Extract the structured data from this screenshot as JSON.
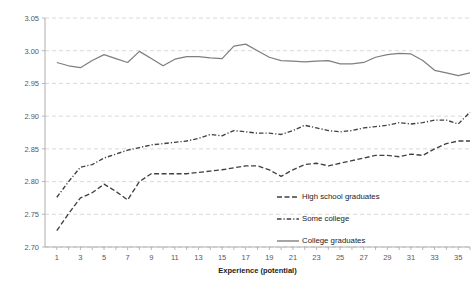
{
  "chart_data": {
    "type": "line",
    "title": "",
    "xlabel": "Experience (potential)",
    "ylabel": "",
    "xlim": [
      0,
      36
    ],
    "ylim": [
      2.7,
      3.05
    ],
    "grid": true,
    "legend_position": "center-right-inside",
    "ytick_labels": [
      "2.70",
      "2.75",
      "2.80",
      "2.85",
      "2.90",
      "2.95",
      "3.00",
      "3.05"
    ],
    "ytick_values": [
      2.7,
      2.75,
      2.8,
      2.85,
      2.9,
      2.95,
      3.0,
      3.05
    ],
    "xtick_labels": [
      "1",
      "3",
      "5",
      "7",
      "9",
      "11",
      "13",
      "15",
      "17",
      "19",
      "21",
      "23",
      "25",
      "27",
      "29",
      "31",
      "33",
      "35"
    ],
    "xtick_values": [
      1,
      3,
      5,
      7,
      9,
      11,
      13,
      15,
      17,
      19,
      21,
      23,
      25,
      27,
      29,
      31,
      33,
      35
    ],
    "x": [
      1,
      2,
      3,
      4,
      5,
      6,
      7,
      8,
      9,
      10,
      11,
      12,
      13,
      14,
      15,
      16,
      17,
      18,
      19,
      20,
      21,
      22,
      23,
      24,
      25,
      26,
      27,
      28,
      29,
      30,
      31,
      32,
      33,
      34,
      35,
      36
    ],
    "series": [
      {
        "name": "High school graduates",
        "style": "dashed",
        "color": "#404040",
        "values": [
          2.725,
          2.751,
          2.775,
          2.783,
          2.796,
          2.785,
          2.772,
          2.8,
          2.812,
          2.812,
          2.812,
          2.812,
          2.814,
          2.816,
          2.818,
          2.821,
          2.824,
          2.824,
          2.818,
          2.808,
          2.818,
          2.826,
          2.828,
          2.824,
          2.828,
          2.832,
          2.836,
          2.84,
          2.84,
          2.838,
          2.842,
          2.84,
          2.85,
          2.858,
          2.862,
          2.862
        ]
      },
      {
        "name": "Some college",
        "style": "dashdot",
        "color": "#404040",
        "values": [
          2.776,
          2.8,
          2.822,
          2.826,
          2.836,
          2.842,
          2.848,
          2.852,
          2.856,
          2.858,
          2.86,
          2.862,
          2.866,
          2.872,
          2.87,
          2.878,
          2.876,
          2.874,
          2.874,
          2.872,
          2.878,
          2.886,
          2.882,
          2.878,
          2.876,
          2.878,
          2.882,
          2.884,
          2.886,
          2.89,
          2.888,
          2.89,
          2.894,
          2.894,
          2.888,
          2.906
        ]
      },
      {
        "name": "College graduates",
        "style": "solid",
        "color": "#7f7f7f",
        "values": [
          2.982,
          2.977,
          2.974,
          2.985,
          2.994,
          2.988,
          2.982,
          2.999,
          2.988,
          2.977,
          2.987,
          2.991,
          2.991,
          2.989,
          2.988,
          3.007,
          3.01,
          3.0,
          2.99,
          2.985,
          2.984,
          2.983,
          2.984,
          2.985,
          2.98,
          2.98,
          2.982,
          2.99,
          2.994,
          2.996,
          2.995,
          2.985,
          2.97,
          2.966,
          2.962,
          2.966
        ]
      }
    ],
    "legend_entries": [
      {
        "label": "High school graduates",
        "style": "dashed",
        "color": "#404040"
      },
      {
        "label": "Some college",
        "style": "dashdot",
        "color": "#404040"
      },
      {
        "label": "College graduates",
        "style": "solid",
        "color": "#7f7f7f"
      }
    ]
  }
}
